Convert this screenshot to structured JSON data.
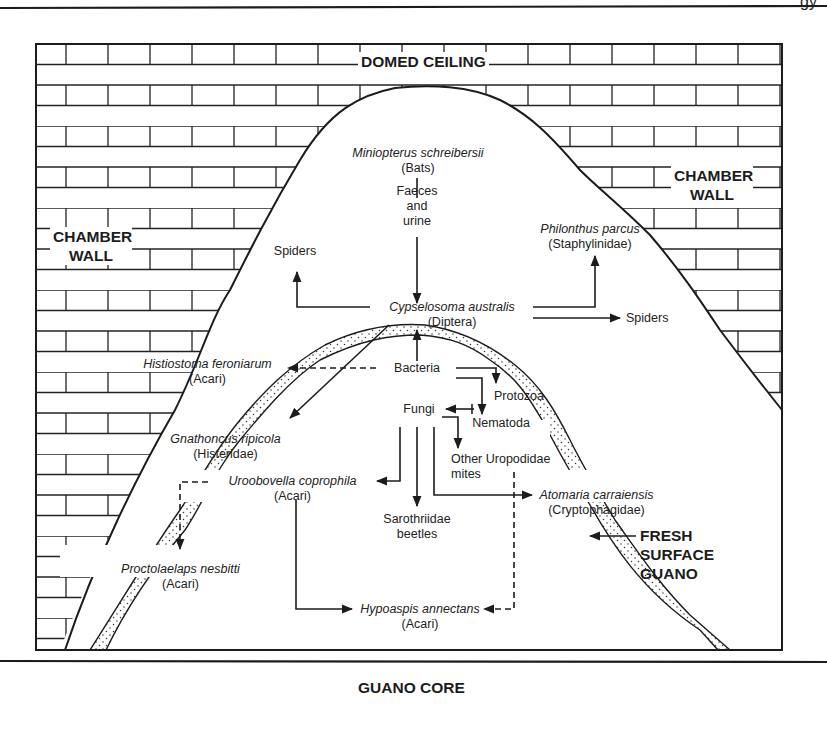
{
  "header": {
    "page_corner_text": "gy"
  },
  "diagram": {
    "title_labels": {
      "domed_ceiling": "DOMED CEILING",
      "chamber_wall_left": [
        "CHAMBER",
        "WALL"
      ],
      "chamber_wall_right": [
        "CHAMBER",
        "WALL"
      ],
      "fresh_surface_guano": [
        "FRESH",
        "SURFACE",
        "GUANO"
      ],
      "guano_core": "GUANO CORE"
    },
    "nodes": {
      "bats": {
        "species": "Miniopterus schreibersii",
        "group": "(Bats)"
      },
      "faeces": {
        "lines": [
          "Faeces",
          "and",
          "urine"
        ]
      },
      "cypselosoma": {
        "species": "Cypselosoma australis",
        "group": "(Diptera)"
      },
      "spiders_left": {
        "label": "Spiders"
      },
      "spiders_right": {
        "label": "Spiders"
      },
      "philonthus": {
        "species": "Philonthus parcus",
        "group": "(Staphylinidae)"
      },
      "histiostoma": {
        "species": "Histiostoma feroniarum",
        "group": "(Acari)"
      },
      "gnathoncus": {
        "species": "Gnathoncus ripicola",
        "group": "(Histeridae)"
      },
      "bacteria": {
        "label": "Bacteria"
      },
      "protozoa": {
        "label": "Protozoa"
      },
      "fungi": {
        "label": "Fungi"
      },
      "nematoda": {
        "label": "Nematoda"
      },
      "other_uropodidae": {
        "lines": [
          "Other Uropodidae",
          "mites"
        ]
      },
      "uroobovella": {
        "species": "Uroobovella coprophila",
        "group": "(Acari)"
      },
      "sarothriidae": {
        "lines": [
          "Sarothriidae",
          "beetles"
        ]
      },
      "atomaria": {
        "species": "Atomaria carraiensis",
        "group": "(Cryptophagidae)"
      },
      "proctolaelaps": {
        "species": "Proctolaelaps nesbitti",
        "group": "(Acari)"
      },
      "hypoaspis": {
        "species": "Hypoaspis annectans",
        "group": "(Acari)"
      }
    },
    "edges": [
      {
        "from": "Miniopterus schreibersii",
        "to": "Cypselosoma australis",
        "via": "Faeces and urine",
        "style": "solid"
      },
      {
        "from": "Cypselosoma australis",
        "to": "Spiders (left)",
        "style": "solid"
      },
      {
        "from": "Cypselosoma australis",
        "to": "Philonthus parcus",
        "style": "solid"
      },
      {
        "from": "Cypselosoma australis",
        "to": "Spiders (right)",
        "style": "solid"
      },
      {
        "from": "Cypselosoma australis",
        "to": "Gnathoncus ripicola",
        "style": "solid"
      },
      {
        "from": "Bacteria",
        "to": "Cypselosoma australis",
        "style": "solid"
      },
      {
        "from": "Bacteria",
        "to": "Histiostoma feroniarum",
        "style": "dashed"
      },
      {
        "from": "Bacteria",
        "to": "Protozoa",
        "style": "solid"
      },
      {
        "from": "Bacteria",
        "to": "Nematoda",
        "style": "solid"
      },
      {
        "from": "Nematoda",
        "to": "Fungi",
        "style": "solid"
      },
      {
        "from": "Fungi",
        "to": "Other Uropodidae mites",
        "style": "solid"
      },
      {
        "from": "Fungi",
        "to": "Uroobovella coprophila",
        "style": "solid"
      },
      {
        "from": "Fungi",
        "to": "Sarothriidae beetles",
        "style": "solid"
      },
      {
        "from": "Fungi",
        "to": "Atomaria carraiensis",
        "style": "solid"
      },
      {
        "from": "Uroobovella coprophila",
        "to": "Proctolaelaps nesbitti",
        "style": "dashed"
      },
      {
        "from": "Uroobovella coprophila",
        "to": "Hypoaspis annectans",
        "style": "solid"
      },
      {
        "from": "Other Uropodidae mites",
        "to": "Hypoaspis annectans",
        "style": "dashed"
      }
    ],
    "colors": {
      "ink": "#1c1c1c",
      "paper": "#ffffff"
    }
  }
}
